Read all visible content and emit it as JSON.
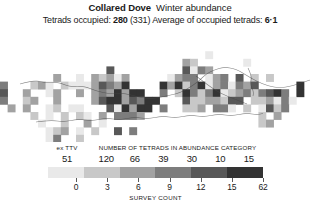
{
  "header": {
    "species": "Collared Dove",
    "season": "Winter abundance",
    "subtitle_prefix": "Tetrads occupied: ",
    "tetrads_occupied": "280",
    "tetrads_total": " (331) ",
    "subtitle_mid": "Average of occupied tetrads: ",
    "average_occupied": "6·1"
  },
  "legend": {
    "ex_header": "ex TTV",
    "category_header": "NUMBER OF TETRADS IN ABUNDANCE CATEGORY",
    "ex_count": "51",
    "category_counts": [
      "120",
      "66",
      "39",
      "30",
      "10",
      "15"
    ],
    "band_colors": [
      "#e9e9e9",
      "#c8c8c8",
      "#a2a2a2",
      "#7d7d7d",
      "#585858",
      "#333333"
    ],
    "ex_color": "#efefef",
    "axis_title": "SURVEY COUNT",
    "tick_labels": [
      "0",
      "3",
      "6",
      "9",
      "12",
      "15",
      "62"
    ]
  },
  "chart_data": {
    "type": "heatmap",
    "subtitle": "Tetrads occupied: 280 (331) Average of occupied tetrads: 6·1",
    "xlabel": "SURVEY COUNT",
    "ylabel": "",
    "legend_position": "bottom",
    "grid": false,
    "colorbar": {
      "label": "SURVEY COUNT",
      "tick_values": [
        0,
        3,
        6,
        9,
        12,
        15,
        62
      ],
      "tick_labels": [
        "0",
        "3",
        "6",
        "9",
        "12",
        "15",
        "62"
      ],
      "band_colors": [
        "#e9e9e9",
        "#c8c8c8",
        "#a2a2a2",
        "#7d7d7d",
        "#585858",
        "#333333"
      ],
      "band_counts": [
        120,
        66,
        39,
        30,
        10,
        15
      ],
      "ex_ttv_count": 51
    },
    "summary": {
      "tetrads_occupied": 280,
      "tetrads_total": 331,
      "average_of_occupied_tetrads": 6.1
    },
    "cell_size_px": 8,
    "cells": [
      [
        4,
        12,
        2
      ],
      [
        5,
        12,
        5
      ],
      [
        6,
        12,
        1
      ],
      [
        7,
        12,
        2
      ],
      [
        10,
        12,
        0
      ],
      [
        11,
        12,
        1
      ],
      [
        3,
        13,
        1
      ],
      [
        4,
        13,
        2
      ],
      [
        5,
        13,
        5
      ],
      [
        6,
        13,
        3
      ],
      [
        7,
        13,
        1
      ],
      [
        9,
        13,
        2
      ],
      [
        10,
        13,
        1
      ],
      [
        11,
        13,
        0
      ],
      [
        3,
        14,
        3
      ],
      [
        4,
        14,
        1
      ],
      [
        5,
        14,
        2
      ],
      [
        6,
        14,
        2
      ],
      [
        7,
        14,
        1
      ],
      [
        8,
        14,
        0
      ],
      [
        9,
        14,
        1
      ],
      [
        10,
        14,
        2
      ],
      [
        11,
        14,
        1
      ],
      [
        2,
        15,
        1
      ],
      [
        3,
        15,
        2
      ],
      [
        4,
        15,
        3
      ],
      [
        5,
        15,
        1
      ],
      [
        6,
        15,
        4
      ],
      [
        7,
        15,
        2
      ],
      [
        8,
        15,
        1
      ],
      [
        9,
        15,
        3
      ],
      [
        10,
        15,
        2
      ],
      [
        11,
        15,
        1
      ],
      [
        12,
        15,
        0
      ],
      [
        2,
        16,
        2
      ],
      [
        3,
        16,
        1
      ],
      [
        4,
        16,
        2
      ],
      [
        5,
        16,
        3
      ],
      [
        6,
        16,
        2
      ],
      [
        7,
        16,
        1
      ],
      [
        8,
        16,
        2
      ],
      [
        9,
        16,
        1
      ],
      [
        10,
        16,
        3
      ],
      [
        11,
        16,
        2
      ],
      [
        12,
        16,
        1
      ],
      [
        1,
        17,
        1
      ],
      [
        2,
        17,
        2
      ],
      [
        3,
        17,
        1
      ],
      [
        4,
        17,
        3
      ],
      [
        5,
        17,
        2
      ],
      [
        6,
        17,
        5
      ],
      [
        7,
        17,
        2
      ],
      [
        8,
        17,
        1
      ],
      [
        9,
        17,
        2
      ],
      [
        10,
        17,
        1
      ],
      [
        11,
        17,
        2
      ],
      [
        12,
        17,
        3
      ],
      [
        1,
        18,
        2
      ],
      [
        2,
        18,
        1
      ],
      [
        3,
        18,
        3
      ],
      [
        4,
        18,
        2
      ],
      [
        5,
        18,
        1
      ],
      [
        6,
        18,
        2
      ],
      [
        7,
        18,
        3
      ],
      [
        8,
        18,
        2
      ],
      [
        9,
        18,
        1
      ],
      [
        10,
        18,
        2
      ],
      [
        11,
        18,
        1
      ],
      [
        12,
        18,
        2
      ],
      [
        13,
        18,
        1
      ],
      [
        2,
        19,
        1
      ],
      [
        3,
        19,
        2
      ],
      [
        4,
        19,
        1
      ],
      [
        5,
        19,
        3
      ],
      [
        6,
        19,
        2
      ],
      [
        7,
        19,
        1
      ],
      [
        8,
        19,
        2
      ],
      [
        9,
        19,
        3
      ],
      [
        10,
        19,
        2
      ],
      [
        11,
        19,
        1
      ],
      [
        12,
        19,
        2
      ],
      [
        13,
        19,
        1
      ]
    ]
  }
}
